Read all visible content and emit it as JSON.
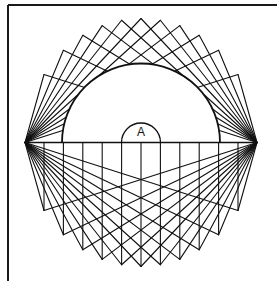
{
  "figure": {
    "label_A": "A",
    "colors": {
      "stroke": "#111111",
      "background": "#ffffff",
      "frame": "#1a1a1a"
    },
    "geometry": {
      "left_vertex": [
        25,
        142.5
      ],
      "right_vertex": [
        257,
        142.5
      ],
      "center": [
        141,
        142.5
      ],
      "outer_rx": 116,
      "outer_ry": 124,
      "big_semicircle_radius": 79,
      "small_arch_radius": 19.5,
      "vertical_x": [
        44,
        63.4,
        82.8,
        102.2,
        121.6,
        141,
        160.4,
        179.8,
        199.2,
        218.6,
        238
      ],
      "frame_left_x": 8,
      "frame_top_y": 5
    }
  }
}
